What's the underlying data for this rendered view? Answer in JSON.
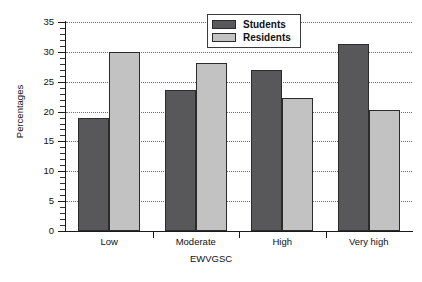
{
  "chart_data": {
    "type": "bar",
    "title": "",
    "xlabel": "EWVGSC",
    "ylabel": "Percentages",
    "categories": [
      "Low",
      "Moderate",
      "High",
      "Very high"
    ],
    "series": [
      {
        "name": "Students",
        "color": "#58585a",
        "values": [
          19.0,
          23.6,
          27.0,
          31.4
        ]
      },
      {
        "name": "Residents",
        "color": "#c2c2c2",
        "values": [
          30.0,
          28.2,
          22.3,
          20.3
        ]
      }
    ],
    "ylim": [
      0,
      35
    ],
    "yticks": [
      0,
      5,
      10,
      15,
      20,
      25,
      30,
      35
    ],
    "ytick_labels": [
      "0",
      "5",
      "10",
      "15",
      "20",
      "25",
      "30",
      "35"
    ],
    "grid": true,
    "grid_axis": "y",
    "grid_style": "dotted",
    "legend_position": "top-center",
    "legend_entries": [
      "Students",
      "Residents"
    ],
    "background": "#ffffff",
    "axis_color": "#1a1a1a"
  }
}
